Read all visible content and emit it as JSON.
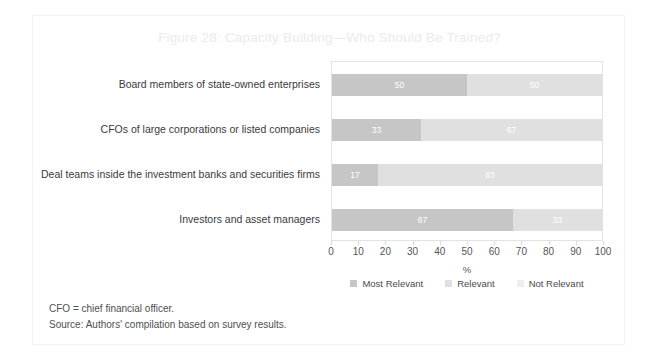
{
  "figure": {
    "title": "Figure 28: Capacity Building—Who Should Be Trained?",
    "footnotes": [
      "CFO = chief financial officer.",
      "Source: Authors' compilation based on survey results."
    ]
  },
  "colors": {
    "most_relevant": "#c6c6c6",
    "relevant": "#e0e0e0",
    "not_relevant": "#eeeeee",
    "title": "#ebebeb",
    "axis": "#e3e3e3",
    "text": "#3a3a3a"
  },
  "chart_data": {
    "type": "bar",
    "orientation": "horizontal",
    "stacked": true,
    "title": "Figure 28: Capacity Building—Who Should Be Trained?",
    "xlabel": "%",
    "ylabel": "",
    "xlim": [
      0,
      100
    ],
    "xticks": [
      0,
      10,
      20,
      30,
      40,
      50,
      60,
      70,
      80,
      90,
      100
    ],
    "xticklabels": [
      "0",
      "10",
      "20",
      "30",
      "40",
      "50",
      "60",
      "70",
      "80",
      "90",
      "100"
    ],
    "grid": false,
    "legend_position": "bottom",
    "categories": [
      "Board members of state-owned enterprises",
      "CFOs of large corporations or listed companies",
      "Deal teams inside the investment banks and securities firms",
      "Investors and asset managers"
    ],
    "series": [
      {
        "name": "Most Relevant",
        "color": "#c6c6c6",
        "values": [
          50,
          33,
          17,
          67
        ]
      },
      {
        "name": "Relevant",
        "color": "#e0e0e0",
        "values": [
          50,
          67,
          83,
          33
        ]
      },
      {
        "name": "Not Relevant",
        "color": "#eeeeee",
        "values": [
          0,
          0,
          0,
          0
        ]
      }
    ],
    "bars": [
      {
        "category": "Board members of state-owned enterprises",
        "segments": [
          {
            "series": "Most Relevant",
            "value": 50,
            "label": "50"
          },
          {
            "series": "Relevant",
            "value": 50,
            "label": "50"
          }
        ]
      },
      {
        "category": "CFOs of large corporations or listed companies",
        "segments": [
          {
            "series": "Most Relevant",
            "value": 33,
            "label": "33"
          },
          {
            "series": "Relevant",
            "value": 67,
            "label": "67"
          }
        ]
      },
      {
        "category": "Deal teams inside the investment banks and securities firms",
        "segments": [
          {
            "series": "Most Relevant",
            "value": 17,
            "label": "17"
          },
          {
            "series": "Relevant",
            "value": 83,
            "label": "83"
          }
        ]
      },
      {
        "category": "Investors and asset managers",
        "segments": [
          {
            "series": "Most Relevant",
            "value": 67,
            "label": "67"
          },
          {
            "series": "Relevant",
            "value": 33,
            "label": "33"
          }
        ]
      }
    ],
    "legend": [
      {
        "label": "Most Relevant",
        "color": "#c6c6c6"
      },
      {
        "label": "Relevant",
        "color": "#e0e0e0"
      },
      {
        "label": "Not Relevant",
        "color": "#eeeeee"
      }
    ]
  }
}
